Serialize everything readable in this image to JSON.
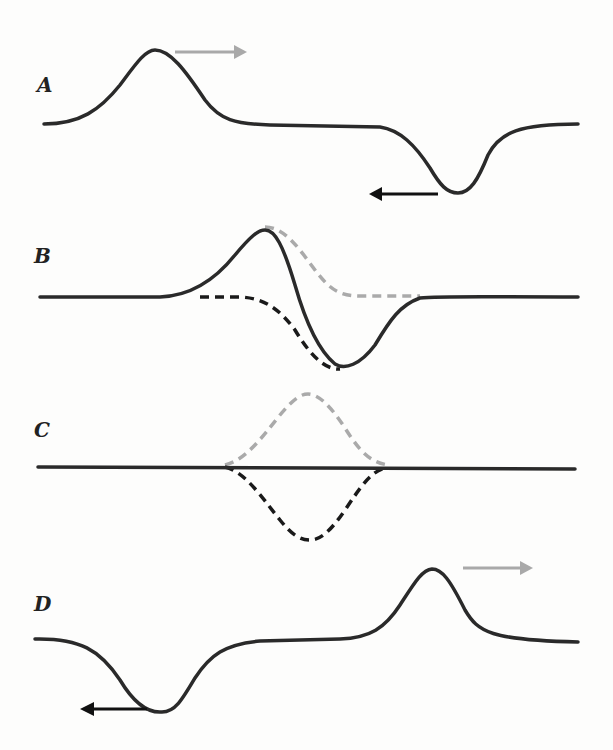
{
  "panels": [
    {
      "label": "A",
      "description": "Positive pulse moving right, negative pulse moving left, separated",
      "right_arrow_color": "#a9a9a9",
      "left_arrow_color": "#111111"
    },
    {
      "label": "B",
      "description": "Pulses partially overlapping; solid curve is the sum, dashed gray = right-moving pulse, dashed black = left-moving pulse"
    },
    {
      "label": "C",
      "description": "Pulses fully overlapping; resultant displacement is flat (destructive interference)"
    },
    {
      "label": "D",
      "description": "Pulses have passed through each other; positive pulse continues right, negative pulse continues left",
      "right_arrow_color": "#a9a9a9",
      "left_arrow_color": "#111111"
    }
  ],
  "colors": {
    "wave": "#2a2a2a",
    "gray_dashed": "#aaaaaa",
    "black_dashed": "#1a1a1a",
    "background": "#fdfdfc"
  }
}
